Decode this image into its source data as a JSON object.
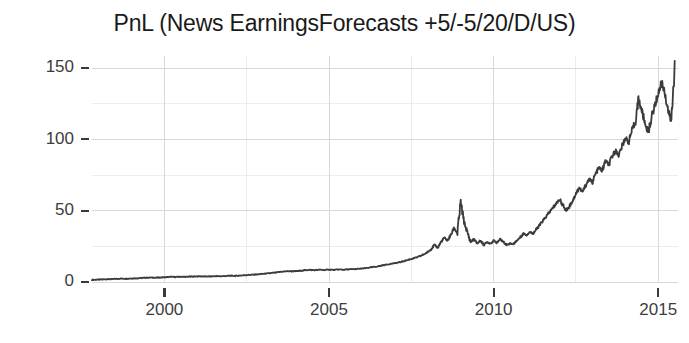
{
  "chart_data": {
    "type": "line",
    "title": "PnL (News EarningsForecasts +5/-5/20/D/US)",
    "xlabel": "",
    "ylabel": "",
    "xlim": [
      1997.8,
      2015.6
    ],
    "ylim": [
      -6,
      162
    ],
    "grid": true,
    "grid_major_y": [
      0,
      50,
      100,
      150
    ],
    "grid_minor_y": [
      25,
      75,
      125
    ],
    "grid_major_x": [
      2000,
      2005,
      2010,
      2015
    ],
    "grid_minor_x": [
      1997.5,
      2002.5,
      2007.5,
      2012.5
    ],
    "legend": null,
    "legend_position": "none",
    "line_color": "#3b3b3b",
    "xticks": [
      2000,
      2005,
      2010,
      2015
    ],
    "xticklabels": [
      "2000",
      "2005",
      "2010",
      "2015"
    ],
    "yticks": [
      0,
      50,
      100,
      150
    ],
    "yticklabels": [
      "0",
      "50",
      "100",
      "150"
    ],
    "series": [
      {
        "name": "PnL",
        "x": [
          1997.8,
          1997.95,
          1998.1,
          1998.25,
          1998.4,
          1998.55,
          1998.7,
          1998.85,
          1999.0,
          1999.15,
          1999.3,
          1999.45,
          1999.6,
          1999.75,
          1999.9,
          2000.05,
          2000.2,
          2000.35,
          2000.5,
          2000.65,
          2000.8,
          2000.95,
          2001.1,
          2001.25,
          2001.4,
          2001.55,
          2001.7,
          2001.85,
          2002.0,
          2002.15,
          2002.3,
          2002.45,
          2002.6,
          2002.75,
          2002.9,
          2003.05,
          2003.2,
          2003.35,
          2003.5,
          2003.65,
          2003.8,
          2003.95,
          2004.1,
          2004.25,
          2004.4,
          2004.55,
          2004.7,
          2004.85,
          2005.0,
          2005.15,
          2005.3,
          2005.45,
          2005.6,
          2005.75,
          2005.9,
          2006.05,
          2006.2,
          2006.35,
          2006.5,
          2006.65,
          2006.8,
          2006.95,
          2007.1,
          2007.25,
          2007.4,
          2007.55,
          2007.7,
          2007.85,
          2008.0,
          2008.1,
          2008.2,
          2008.3,
          2008.4,
          2008.5,
          2008.6,
          2008.7,
          2008.8,
          2008.9,
          2009.0,
          2009.1,
          2009.2,
          2009.3,
          2009.4,
          2009.5,
          2009.6,
          2009.7,
          2009.8,
          2009.9,
          2010.0,
          2010.1,
          2010.2,
          2010.3,
          2010.4,
          2010.5,
          2010.6,
          2010.7,
          2010.8,
          2010.9,
          2011.0,
          2011.1,
          2011.2,
          2011.3,
          2011.4,
          2011.5,
          2011.6,
          2011.7,
          2011.8,
          2011.9,
          2012.0,
          2012.1,
          2012.2,
          2012.3,
          2012.4,
          2012.5,
          2012.6,
          2012.7,
          2012.8,
          2012.9,
          2013.0,
          2013.1,
          2013.2,
          2013.3,
          2013.4,
          2013.5,
          2013.6,
          2013.7,
          2013.8,
          2013.9,
          2014.0,
          2014.1,
          2014.2,
          2014.3,
          2014.4,
          2014.5,
          2014.6,
          2014.7,
          2014.8,
          2014.9,
          2015.0,
          2015.1,
          2015.2,
          2015.3,
          2015.4,
          2015.5
        ],
        "y": [
          1.5,
          1.6,
          1.8,
          2.0,
          2.0,
          2.2,
          2.4,
          2.3,
          2.5,
          2.6,
          2.8,
          3.0,
          3.1,
          3.0,
          3.2,
          3.4,
          3.6,
          3.5,
          3.7,
          3.6,
          3.8,
          3.9,
          4.0,
          3.8,
          3.9,
          4.1,
          4.0,
          4.2,
          4.4,
          4.3,
          4.5,
          4.8,
          5.0,
          5.2,
          5.5,
          5.8,
          6.2,
          6.5,
          7.0,
          7.4,
          7.6,
          7.5,
          7.8,
          8.2,
          8.5,
          8.3,
          8.6,
          8.4,
          8.7,
          8.5,
          8.8,
          8.6,
          8.9,
          9.0,
          9.2,
          9.5,
          10.0,
          10.5,
          11.0,
          11.8,
          12.4,
          13.0,
          13.6,
          14.5,
          15.5,
          16.5,
          17.5,
          19.0,
          21.0,
          23.0,
          26.0,
          24.0,
          28.0,
          31.0,
          29.0,
          33.0,
          38.0,
          34.0,
          56.0,
          42.0,
          35.0,
          28.0,
          30.0,
          27.0,
          29.0,
          26.0,
          28.0,
          27.0,
          29.0,
          27.5,
          30.0,
          28.0,
          26.0,
          27.0,
          26.5,
          29.0,
          31.0,
          34.0,
          33.0,
          35.0,
          34.0,
          37.0,
          40.0,
          43.0,
          46.0,
          49.0,
          52.0,
          55.0,
          58.0,
          54.0,
          50.0,
          53.0,
          57.0,
          62.0,
          66.0,
          63.0,
          68.0,
          72.0,
          70.0,
          76.0,
          80.0,
          78.0,
          85.0,
          82.0,
          88.0,
          92.0,
          89.0,
          95.0,
          101.0,
          98.0,
          106.0,
          112.0,
          128.0,
          120.0,
          111.0,
          105.0,
          116.0,
          124.0,
          132.0,
          140.0,
          133.0,
          120.0,
          112.0,
          155.0
        ]
      }
    ]
  },
  "axes": {
    "y_tick_labels": [
      "150",
      "100",
      "50",
      "0"
    ],
    "x_tick_labels": [
      "2000",
      "2005",
      "2010",
      "2015"
    ]
  }
}
